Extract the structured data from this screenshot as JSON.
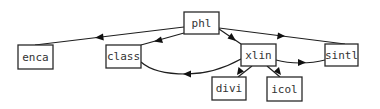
{
  "diagram": {
    "type": "call-graph",
    "colors": {
      "stroke": "#2a2a2a",
      "text": "#333333",
      "background": "#ffffff"
    },
    "nodes": [
      {
        "id": "phl",
        "label": "phl",
        "x": 184,
        "y": 12,
        "w": 35,
        "h": 22
      },
      {
        "id": "enca",
        "label": "enca",
        "x": 18,
        "y": 45,
        "w": 35,
        "h": 24
      },
      {
        "id": "class",
        "label": "class",
        "x": 106,
        "y": 45,
        "w": 35,
        "h": 23
      },
      {
        "id": "xlin",
        "label": "xlin",
        "x": 241,
        "y": 44,
        "w": 35,
        "h": 22
      },
      {
        "id": "sintl",
        "label": "sintl",
        "x": 325,
        "y": 44,
        "w": 33,
        "h": 22
      },
      {
        "id": "divi",
        "label": "divi",
        "x": 212,
        "y": 77,
        "w": 34,
        "h": 23
      },
      {
        "id": "icol",
        "label": "icol",
        "x": 267,
        "y": 77,
        "w": 35,
        "h": 24
      }
    ],
    "edges": [
      {
        "from": "phl",
        "to": "enca"
      },
      {
        "from": "phl",
        "to": "class"
      },
      {
        "from": "phl",
        "to": "xlin"
      },
      {
        "from": "sintl",
        "to": "phl",
        "arrow_direction": "toward sintl"
      },
      {
        "from": "xlin",
        "to": "class",
        "curved": true
      },
      {
        "from": "xlin",
        "to": "sintl",
        "curved": true
      },
      {
        "from": "xlin",
        "to": "divi"
      },
      {
        "from": "xlin",
        "to": "icol"
      }
    ]
  }
}
